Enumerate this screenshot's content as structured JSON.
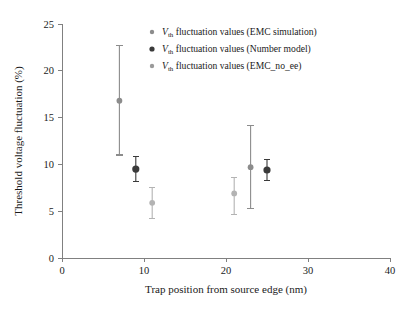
{
  "chart_data": {
    "type": "scatter",
    "title": "",
    "xlabel": "Trap position from source edge (nm)",
    "ylabel": "Threshold voltage fluctuation (%)",
    "xlim": [
      0,
      40
    ],
    "ylim": [
      0,
      25
    ],
    "xticks": [
      0,
      10,
      20,
      30,
      40
    ],
    "yticks": [
      0,
      5,
      10,
      15,
      20,
      25
    ],
    "grid": false,
    "legend_position": "top-right-inside",
    "series": [
      {
        "name": "Vth fluctuation values (EMC simulation)",
        "label_prefix": "V",
        "label_sub": "th",
        "label_rest": " fluctuation values (EMC simulation)",
        "marker": "filled-circle",
        "color": "#8c8c8c",
        "points": [
          {
            "x": 7.0,
            "y": 16.8,
            "ylow": 11.0,
            "yhigh": 22.7
          },
          {
            "x": 23.0,
            "y": 9.7,
            "ylow": 5.3,
            "yhigh": 14.2
          }
        ]
      },
      {
        "name": "Vth fluctuation values (Number model)",
        "label_prefix": "V",
        "label_sub": "th",
        "label_rest": " fluctuation values (Number model)",
        "marker": "filled-circle",
        "color": "#3a3a3a",
        "points": [
          {
            "x": 9.0,
            "y": 9.5,
            "ylow": 8.2,
            "yhigh": 10.8
          },
          {
            "x": 25.0,
            "y": 9.4,
            "ylow": 8.3,
            "yhigh": 10.5
          }
        ]
      },
      {
        "name": "Vth fluctuation values (EMC_no_ee)",
        "label_prefix": "V",
        "label_sub": "th",
        "label_rest": " fluctuation values (EMC_no_ee)",
        "marker": "filled-circle",
        "color": "#b3b3b3",
        "points": [
          {
            "x": 11.0,
            "y": 5.9,
            "ylow": 4.2,
            "yhigh": 7.5
          },
          {
            "x": 21.0,
            "y": 6.9,
            "ylow": 4.6,
            "yhigh": 8.6
          }
        ]
      }
    ]
  },
  "axes": {
    "x_tick_labels": [
      "0",
      "10",
      "20",
      "30",
      "40"
    ],
    "y_tick_labels": [
      "0",
      "5",
      "10",
      "15",
      "20",
      "25"
    ],
    "x_axis_title": "Trap position from source edge (nm)",
    "y_axis_title": "Threshold voltage fluctuation (%)"
  },
  "legend": {
    "items": [
      {
        "marker_color": "#8c8c8c",
        "marker_size": 2.2,
        "text_v": "V",
        "text_sub": "th",
        "text_rest": " fluctuation values (EMC simulation)"
      },
      {
        "marker_color": "#3a3a3a",
        "marker_size": 2.6,
        "text_v": "V",
        "text_sub": "th",
        "text_rest": " fluctuation values (Number model)"
      },
      {
        "marker_color": "#9a9a9a",
        "marker_size": 2.2,
        "text_v": "V",
        "text_sub": "th",
        "text_rest": " fluctuation values (EMC_no_ee)"
      }
    ]
  },
  "colors": {
    "axis": "#808080",
    "text": "#1a1a1a",
    "background": "#ffffff",
    "series_emc": "#8c8c8c",
    "series_number_model": "#3a3a3a",
    "series_emc_no_ee": "#b3b3b3"
  }
}
